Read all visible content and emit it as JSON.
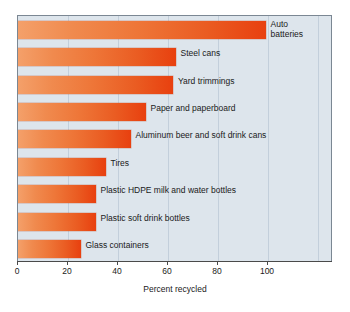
{
  "chart_data": {
    "type": "bar",
    "orientation": "horizontal",
    "title": "",
    "xlabel": "Percent recycled",
    "ylabel": "",
    "xlim": [
      0,
      126
    ],
    "xticks": [
      0,
      20,
      40,
      60,
      80,
      100
    ],
    "xtick_labels": [
      "0",
      "20",
      "40",
      "60",
      "80",
      "100"
    ],
    "grid": true,
    "grid_axis": "x",
    "legend": false,
    "categories": [
      "Auto batteries",
      "Steel cans",
      "Yard trimmings",
      "Paper and paperboard",
      "Aluminum beer and soft drink cans",
      "Tires",
      "Plastic HDPE milk and water bottles",
      "Plastic soft drink bottles",
      "Glass containers"
    ],
    "values": [
      99,
      63,
      62,
      51,
      45,
      35,
      31,
      31,
      25
    ],
    "bar_labels": [
      "Auto batteries",
      "Steel cans",
      "Yard trimmings",
      "Paper and paperboard",
      "Aluminum beer and soft drink cans",
      "Tires",
      "Plastic HDPE milk and water bottles",
      "Plastic soft drink bottles",
      "Glass containers"
    ],
    "bar_label_lines": [
      [
        "Auto",
        "batteries"
      ],
      [
        "Steel cans"
      ],
      [
        "Yard trimmings"
      ],
      [
        "Paper and paperboard"
      ],
      [
        "Aluminum beer and soft drink cans"
      ],
      [
        "Tires"
      ],
      [
        "Plastic HDPE milk and water bottles"
      ],
      [
        "Plastic soft drink bottles"
      ],
      [
        "Glass containers"
      ]
    ],
    "colors": {
      "bar_gradient_start": "#f4a06a",
      "bar_gradient_end": "#e8400f",
      "plot_background": "#dde5ec",
      "gridline": "#c3cfdb",
      "frame": "#7b8793",
      "axis": "#4a4a4a",
      "text": "#1a1a1a",
      "page_background": "#ffffff"
    }
  },
  "axis": {
    "x_title": "Percent recycled",
    "ticks": [
      {
        "value": "0"
      },
      {
        "value": "20"
      },
      {
        "value": "40"
      },
      {
        "value": "60"
      },
      {
        "value": "80"
      },
      {
        "value": "100"
      }
    ]
  },
  "bars": [
    {
      "label": "Auto batteries",
      "label_line1": "Auto",
      "label_line2": "batteries",
      "value": 99
    },
    {
      "label": "Steel cans",
      "label_line1": "Steel cans",
      "label_line2": "",
      "value": 63
    },
    {
      "label": "Yard trimmings",
      "label_line1": "Yard trimmings",
      "label_line2": "",
      "value": 62
    },
    {
      "label": "Paper and paperboard",
      "label_line1": "Paper and paperboard",
      "label_line2": "",
      "value": 51
    },
    {
      "label": "Aluminum beer and soft drink cans",
      "label_line1": "Aluminum beer and soft drink cans",
      "label_line2": "",
      "value": 45
    },
    {
      "label": "Tires",
      "label_line1": "Tires",
      "label_line2": "",
      "value": 35
    },
    {
      "label": "Plastic HDPE milk and water bottles",
      "label_line1": "Plastic HDPE milk and water bottles",
      "label_line2": "",
      "value": 31
    },
    {
      "label": "Plastic soft drink bottles",
      "label_line1": "Plastic soft drink bottles",
      "label_line2": "",
      "value": 31
    },
    {
      "label": "Glass containers",
      "label_line1": "Glass containers",
      "label_line2": "",
      "value": 25
    }
  ]
}
